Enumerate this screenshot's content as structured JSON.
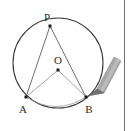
{
  "figure": {
    "background_color": "#ffffff",
    "width": 133,
    "height": 131,
    "circle": {
      "center_x": 58,
      "center_y": 63,
      "radius": 45,
      "stroke_color": "#3a3a3a",
      "stroke_width": 1.1,
      "fill": "none"
    },
    "points": [
      {
        "id": "P",
        "label": "P",
        "x": 50,
        "y": 26,
        "label_x": 48,
        "label_y": 21,
        "marker": "square",
        "marker_size": 3,
        "color": "#1c1c1c"
      },
      {
        "id": "O",
        "label": "O",
        "x": 58,
        "y": 70,
        "label_x": 56,
        "label_y": 64,
        "marker": "square",
        "marker_size": 3,
        "color": "#1c1c1c"
      },
      {
        "id": "A",
        "label": "A",
        "x": 26,
        "y": 97,
        "label_x": 21,
        "label_y": 112,
        "marker": "square",
        "marker_size": 3,
        "color": "#1c1c1c"
      },
      {
        "id": "B",
        "label": "B",
        "x": 86,
        "y": 97,
        "label_x": 87,
        "label_y": 112,
        "marker": "square",
        "marker_size": 3,
        "color": "#1c1c1c"
      }
    ],
    "segments": [
      {
        "id": "PA",
        "from": "P",
        "to": "A",
        "x1": 50,
        "y1": 26,
        "x2": 26,
        "y2": 97,
        "stroke_color": "#4a4a4a",
        "stroke_width": 0.8
      },
      {
        "id": "PB",
        "from": "P",
        "to": "B",
        "x1": 50,
        "y1": 26,
        "x2": 86,
        "y2": 97,
        "stroke_color": "#4a4a4a",
        "stroke_width": 0.8
      },
      {
        "id": "OA",
        "from": "O",
        "to": "A",
        "x1": 58,
        "y1": 70,
        "x2": 26,
        "y2": 97,
        "stroke_color": "#8c8c8c",
        "stroke_width": 0.8
      },
      {
        "id": "OB",
        "from": "O",
        "to": "B",
        "x1": 58,
        "y1": 70,
        "x2": 86,
        "y2": 97,
        "stroke_color": "#8c8c8c",
        "stroke_width": 0.8
      },
      {
        "id": "arc-AB",
        "from": "A",
        "to": "B",
        "x1": 26,
        "y1": 97,
        "x2": 86,
        "y2": 97,
        "stroke_color": "#9a9a9a",
        "stroke_width": 0.8,
        "curve": true
      }
    ],
    "pencil": {
      "name": "pencil-pointer",
      "tip_x": 88,
      "tip_y": 96,
      "tail_x": 119,
      "tail_y": 62,
      "body_color": "#a0a0a0",
      "body_highlight": "#c2c2c2",
      "tip_color": "#6b6b6b",
      "outline_color": "#8a8a8a"
    },
    "right_rule": {
      "name": "page-edge-rule",
      "x": 124,
      "color": "#6f6f6f"
    }
  }
}
